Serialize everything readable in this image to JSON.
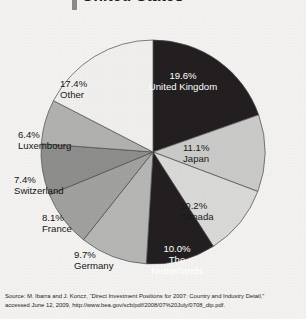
{
  "title": {
    "text": "United States",
    "accent_color": "#8a8a8a"
  },
  "chart_data": {
    "type": "pie",
    "title": "United States",
    "start_angle_deg": 0,
    "direction": "clockwise",
    "units": "percent",
    "categories": [
      "United Kingdom",
      "Japan",
      "Canada",
      "The Netherlands",
      "Germany",
      "France",
      "Switzerland",
      "Luxembourg",
      "Other"
    ],
    "values": [
      19.6,
      11.1,
      10.2,
      10.0,
      9.7,
      8.1,
      7.4,
      6.4,
      17.4
    ],
    "labels": [
      "19.6%\nUnited Kingdom",
      "11.1%\nJapan",
      "10.2%\nCanada",
      "10.0%\nThe Netherlands",
      "9.7%\nGermany",
      "8.1%\nFrance",
      "7.4%\nSwitzerland",
      "6.4%\nLuxembourg",
      "17.4%\nOther"
    ],
    "colors": [
      "#231f20",
      "#c9c9c7",
      "#d8d8d6",
      "#231f20",
      "#b5b5b3",
      "#a0a09e",
      "#8d8d8b",
      "#b0b0ae",
      "#efeeec"
    ],
    "legend": "none",
    "grid": false
  },
  "slices": [
    {
      "pct": "19.6%",
      "name": "United Kingdom"
    },
    {
      "pct": "11.1%",
      "name": "Japan"
    },
    {
      "pct": "10.2%",
      "name": "Canada"
    },
    {
      "pct": "10.0%",
      "name": "The Netherlands",
      "name_line1": "The",
      "name_line2": "Netherlands"
    },
    {
      "pct": "9.7%",
      "name": "Germany"
    },
    {
      "pct": "8.1%",
      "name": "France"
    },
    {
      "pct": "7.4%",
      "name": "Switzerland"
    },
    {
      "pct": "6.4%",
      "name": "Luxembourg"
    },
    {
      "pct": "17.4%",
      "name": "Other"
    }
  ],
  "source": {
    "line1": "Source: M. Ibarra and J. Koncz, “Direct Investment Positions for 2007: Country and Industry Detail,”",
    "line2": "accessed June 12, 2009, http://www.bea.gov/scb/pdf/2008/07%20July/0708_dip.pdf."
  }
}
